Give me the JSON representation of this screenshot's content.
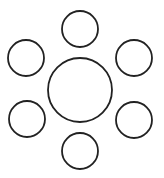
{
  "diagram": {
    "background": "#ffffff",
    "stroke_color": "#222222",
    "stroke_width": 1.8,
    "fill": "none",
    "center_circle": {
      "cx": 80,
      "cy": 90,
      "r": 32
    },
    "satellite_circles": [
      {
        "id": "top",
        "cx": 80,
        "cy": 29,
        "r": 18
      },
      {
        "id": "upper-right",
        "cx": 134,
        "cy": 58,
        "r": 18
      },
      {
        "id": "lower-right",
        "cx": 134,
        "cy": 120,
        "r": 18
      },
      {
        "id": "bottom",
        "cx": 80,
        "cy": 151,
        "r": 18
      },
      {
        "id": "lower-left",
        "cx": 27,
        "cy": 119,
        "r": 18
      },
      {
        "id": "upper-left",
        "cx": 26,
        "cy": 58,
        "r": 18
      }
    ]
  }
}
